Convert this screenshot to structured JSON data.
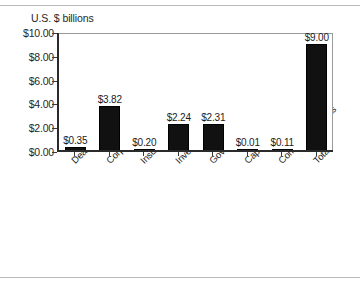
{
  "chart_data": {
    "type": "bar",
    "title": "U.S. $ billions",
    "xlabel": "",
    "ylabel": "U.S. $ billions",
    "ylim": [
      0,
      10
    ],
    "grid": false,
    "legend": null,
    "categories": [
      "Dealers",
      "Corporations",
      "Insurance",
      "Investment funds",
      "Government",
      "Captive finance companies",
      "Commercial banks",
      "Total"
    ],
    "values": [
      0.35,
      3.82,
      0.2,
      2.24,
      2.31,
      0.01,
      0.11,
      9.0
    ],
    "data_labels": [
      "$0.35",
      "$3.82",
      "$0.20",
      "$2.24",
      "$2.31",
      "$0.01",
      "$0.11",
      "$9.00"
    ],
    "ytick_labels": [
      "$0.00",
      "$2.00",
      "$4.00",
      "$6.00",
      "$8.00",
      "$10.00"
    ],
    "ytick_values": [
      0,
      2,
      4,
      6,
      8,
      10
    ],
    "bar_color": "#111111",
    "axis_color": "#2a2a2a",
    "background_color": "#ffffff"
  }
}
